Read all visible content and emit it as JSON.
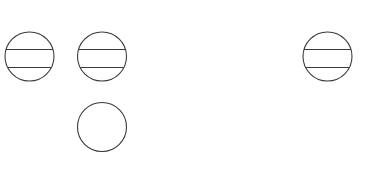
{
  "canvas": {
    "width": 368,
    "height": 170,
    "background": "#ffffff"
  },
  "style": {
    "stroke": "#3a3a3a",
    "stroke_width": 1.1
  },
  "shapes": [
    {
      "id": "circle-1",
      "type": "banded-circle",
      "cx": 29.5,
      "cy": 56.5,
      "r": 24.5,
      "bands": [
        49.5,
        67.5
      ]
    },
    {
      "id": "circle-2",
      "type": "banded-circle",
      "cx": 102,
      "cy": 56.5,
      "r": 24.5,
      "bands": [
        49.5,
        67.5
      ]
    },
    {
      "id": "circle-3",
      "type": "banded-circle",
      "cx": 327.5,
      "cy": 56.5,
      "r": 24.5,
      "bands": [
        49.5,
        67.5
      ]
    },
    {
      "id": "circle-4",
      "type": "plain-circle",
      "cx": 102,
      "cy": 127,
      "r": 24.5,
      "bands": []
    }
  ]
}
